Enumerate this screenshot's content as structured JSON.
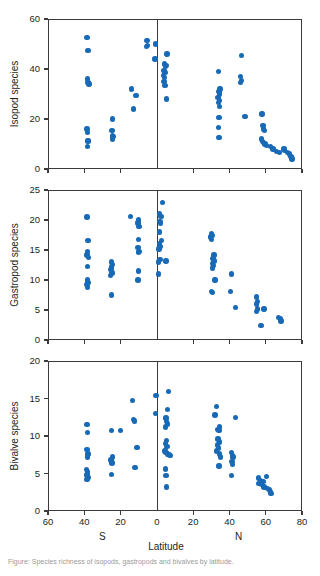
{
  "figure": {
    "xlabel": "Latitude",
    "hemisphere_south": "S",
    "hemisphere_north": "N",
    "marker_color": "#1869b6",
    "axis_color": "#3b3b3b",
    "caption": "Figure: Species richness of isopods, gastropods and bivalves by latitude."
  },
  "chart_data": [
    {
      "type": "scatter",
      "title": "",
      "ylabel": "Isopod species",
      "xlabel": "Latitude",
      "xlim": [
        -60,
        80
      ],
      "ylim": [
        0,
        60
      ],
      "xticks": [
        -60,
        -40,
        -20,
        0,
        20,
        40,
        60,
        80
      ],
      "xticklabels": [
        "60",
        "40",
        "20",
        "0",
        "20",
        "40",
        "60",
        "80"
      ],
      "yticks": [
        0,
        20,
        40,
        60
      ],
      "yticklabels": [
        "0",
        "20",
        "40",
        "60"
      ],
      "grid": false,
      "legend": "none",
      "series": [
        {
          "name": "Isopod species",
          "points": [
            [
              -38.5,
              52.5
            ],
            [
              -38.0,
              47.5
            ],
            [
              -38.2,
              36.0
            ],
            [
              -38.0,
              34.5
            ],
            [
              -37.5,
              34.0
            ],
            [
              -38.6,
              16.0
            ],
            [
              -38.2,
              14.5
            ],
            [
              -38.0,
              11.5
            ],
            [
              -37.9,
              11.0
            ],
            [
              -38.4,
              9.0
            ],
            [
              -24.5,
              20.0
            ],
            [
              -24.8,
              15.5
            ],
            [
              -24.4,
              13.5
            ],
            [
              -24.2,
              13.0
            ],
            [
              -24.6,
              12.0
            ],
            [
              -14.0,
              32.0
            ],
            [
              -11.5,
              29.5
            ],
            [
              -12.8,
              24.0
            ],
            [
              -5.5,
              51.5
            ],
            [
              -5.3,
              49.5
            ],
            [
              -5.6,
              49.0
            ],
            [
              -0.8,
              50.0
            ],
            [
              -1.0,
              44.0
            ],
            [
              5.5,
              46.0
            ],
            [
              4.2,
              42.0
            ],
            [
              5.0,
              41.5
            ],
            [
              4.6,
              41.0
            ],
            [
              4.0,
              39.5
            ],
            [
              4.4,
              38.5
            ],
            [
              3.8,
              37.5
            ],
            [
              4.2,
              36.5
            ],
            [
              3.9,
              35.0
            ],
            [
              4.4,
              33.5
            ],
            [
              5.2,
              28.0
            ],
            [
              34.0,
              39.0
            ],
            [
              34.8,
              32.0
            ],
            [
              34.2,
              31.0
            ],
            [
              34.6,
              30.0
            ],
            [
              33.8,
              28.5
            ],
            [
              34.4,
              27.5
            ],
            [
              34.0,
              26.5
            ],
            [
              34.6,
              25.0
            ],
            [
              34.2,
              20.5
            ],
            [
              34.0,
              16.5
            ],
            [
              34.3,
              12.5
            ],
            [
              46.5,
              45.5
            ],
            [
              46.2,
              37.0
            ],
            [
              46.6,
              35.5
            ],
            [
              46.0,
              34.5
            ],
            [
              48.5,
              21.0
            ],
            [
              58.0,
              22.0
            ],
            [
              58.4,
              17.5
            ],
            [
              58.8,
              16.0
            ],
            [
              59.2,
              15.5
            ],
            [
              57.6,
              12.0
            ],
            [
              58.2,
              11.0
            ],
            [
              58.8,
              10.5
            ],
            [
              59.6,
              10.0
            ],
            [
              60.4,
              9.5
            ],
            [
              62.5,
              9.0
            ],
            [
              64.0,
              8.0
            ],
            [
              66.0,
              7.0
            ],
            [
              67.5,
              6.5
            ],
            [
              70.0,
              8.0
            ],
            [
              70.5,
              7.5
            ],
            [
              72.0,
              6.5
            ],
            [
              73.0,
              6.0
            ],
            [
              74.0,
              5.0
            ],
            [
              74.5,
              4.0
            ]
          ]
        }
      ]
    },
    {
      "type": "scatter",
      "title": "",
      "ylabel": "Gastropod species",
      "xlabel": "Latitude",
      "xlim": [
        -60,
        80
      ],
      "ylim": [
        0,
        25
      ],
      "xticks": [
        -60,
        -40,
        -20,
        0,
        20,
        40,
        60,
        80
      ],
      "xticklabels": [
        "60",
        "40",
        "20",
        "0",
        "20",
        "40",
        "60",
        "80"
      ],
      "yticks": [
        0,
        5,
        10,
        15,
        20,
        25
      ],
      "yticklabels": [
        "0",
        "5",
        "10",
        "15",
        "20",
        "25"
      ],
      "grid": false,
      "legend": "none",
      "series": [
        {
          "name": "Gastropod species",
          "points": [
            [
              -38.5,
              20.5
            ],
            [
              -38.0,
              16.6
            ],
            [
              -38.3,
              14.8
            ],
            [
              -38.6,
              14.2
            ],
            [
              -37.8,
              13.8
            ],
            [
              -38.2,
              12.3
            ],
            [
              -38.4,
              10.0
            ],
            [
              -38.0,
              9.6
            ],
            [
              -38.6,
              9.3
            ],
            [
              -38.2,
              8.8
            ],
            [
              -25.0,
              13.0
            ],
            [
              -24.6,
              12.6
            ],
            [
              -24.9,
              12.2
            ],
            [
              -25.2,
              11.8
            ],
            [
              -24.7,
              11.2
            ],
            [
              -25.4,
              10.8
            ],
            [
              -25.0,
              7.5
            ],
            [
              -14.5,
              20.6
            ],
            [
              -10.0,
              20.0
            ],
            [
              -10.3,
              19.5
            ],
            [
              -9.8,
              18.9
            ],
            [
              -10.1,
              16.8
            ],
            [
              -10.4,
              15.4
            ],
            [
              -9.9,
              14.8
            ],
            [
              -10.2,
              14.6
            ],
            [
              -10.0,
              11.5
            ],
            [
              -10.3,
              10.0
            ],
            [
              3.0,
              22.9
            ],
            [
              1.5,
              21.0
            ],
            [
              2.2,
              20.6
            ],
            [
              1.8,
              19.8
            ],
            [
              2.0,
              19.4
            ],
            [
              1.6,
              18.0
            ],
            [
              2.4,
              16.6
            ],
            [
              1.4,
              16.0
            ],
            [
              2.0,
              15.6
            ],
            [
              1.2,
              15.2
            ],
            [
              1.8,
              13.4
            ],
            [
              1.0,
              13.0
            ],
            [
              5.0,
              13.2
            ],
            [
              0.8,
              11.0
            ],
            [
              30.0,
              17.8
            ],
            [
              30.6,
              17.4
            ],
            [
              29.6,
              17.2
            ],
            [
              30.2,
              16.8
            ],
            [
              31.5,
              14.2
            ],
            [
              31.0,
              13.6
            ],
            [
              31.4,
              13.2
            ],
            [
              30.8,
              12.8
            ],
            [
              31.2,
              12.4
            ],
            [
              30.6,
              12.0
            ],
            [
              32.0,
              10.0
            ],
            [
              30.0,
              8.1
            ],
            [
              30.5,
              7.9
            ],
            [
              41.0,
              11.0
            ],
            [
              40.5,
              8.1
            ],
            [
              43.5,
              5.4
            ],
            [
              55.0,
              7.2
            ],
            [
              55.4,
              6.4
            ],
            [
              55.0,
              6.0
            ],
            [
              55.6,
              5.2
            ],
            [
              54.8,
              4.8
            ],
            [
              59.0,
              5.2
            ],
            [
              57.5,
              2.4
            ],
            [
              67.0,
              3.8
            ],
            [
              68.0,
              3.5
            ],
            [
              68.5,
              3.2
            ]
          ]
        }
      ]
    },
    {
      "type": "scatter",
      "title": "",
      "ylabel": "Bivalve species",
      "xlabel": "Latitude",
      "xlim": [
        -60,
        80
      ],
      "ylim": [
        0,
        20
      ],
      "xticks": [
        -60,
        -40,
        -20,
        0,
        20,
        40,
        60,
        80
      ],
      "xticklabels": [
        "60",
        "40",
        "20",
        "0",
        "20",
        "40",
        "60",
        "80"
      ],
      "yticks": [
        0,
        5,
        10,
        15,
        20
      ],
      "yticklabels": [
        "0",
        "5",
        "10",
        "15",
        "20"
      ],
      "grid": false,
      "legend": "none",
      "series": [
        {
          "name": "Bivalve species",
          "points": [
            [
              -38.5,
              11.5
            ],
            [
              -38.2,
              10.5
            ],
            [
              -38.6,
              8.2
            ],
            [
              -38.0,
              7.6
            ],
            [
              -38.4,
              7.2
            ],
            [
              -38.8,
              5.5
            ],
            [
              -38.2,
              5.2
            ],
            [
              -38.6,
              4.8
            ],
            [
              -38.0,
              4.5
            ],
            [
              -38.5,
              4.2
            ],
            [
              -25.0,
              10.7
            ],
            [
              -24.6,
              7.2
            ],
            [
              -25.2,
              6.8
            ],
            [
              -24.8,
              6.4
            ],
            [
              -25.0,
              4.9
            ],
            [
              -20.0,
              10.7
            ],
            [
              -13.5,
              14.7
            ],
            [
              -13.0,
              12.2
            ],
            [
              -12.4,
              12.0
            ],
            [
              -11.0,
              8.5
            ],
            [
              -12.0,
              5.8
            ],
            [
              -0.5,
              15.4
            ],
            [
              -0.8,
              13.0
            ],
            [
              6.5,
              15.9
            ],
            [
              6.0,
              13.5
            ],
            [
              5.0,
              12.4
            ],
            [
              5.4,
              11.9
            ],
            [
              5.8,
              11.6
            ],
            [
              4.6,
              11.2
            ],
            [
              5.2,
              9.4
            ],
            [
              4.8,
              9.0
            ],
            [
              5.6,
              8.6
            ],
            [
              4.4,
              8.0
            ],
            [
              5.0,
              7.8
            ],
            [
              6.0,
              7.6
            ],
            [
              6.6,
              7.5
            ],
            [
              7.2,
              7.4
            ],
            [
              4.6,
              5.6
            ],
            [
              5.0,
              4.7
            ],
            [
              5.4,
              3.2
            ],
            [
              33.0,
              13.9
            ],
            [
              32.0,
              12.8
            ],
            [
              34.5,
              11.2
            ],
            [
              33.6,
              10.9
            ],
            [
              34.2,
              10.7
            ],
            [
              33.8,
              9.6
            ],
            [
              34.4,
              9.2
            ],
            [
              33.4,
              8.8
            ],
            [
              34.0,
              8.4
            ],
            [
              33.0,
              8.0
            ],
            [
              34.6,
              7.6
            ],
            [
              35.0,
              7.2
            ],
            [
              34.2,
              6.0
            ],
            [
              43.5,
              12.5
            ],
            [
              41.0,
              7.8
            ],
            [
              41.6,
              7.4
            ],
            [
              42.0,
              7.2
            ],
            [
              41.4,
              6.6
            ],
            [
              41.8,
              6.2
            ],
            [
              41.2,
              4.7
            ],
            [
              56.0,
              4.4
            ],
            [
              57.0,
              4.0
            ],
            [
              56.4,
              3.7
            ],
            [
              57.6,
              3.5
            ],
            [
              58.5,
              3.9
            ],
            [
              59.0,
              3.2
            ],
            [
              60.5,
              4.6
            ],
            [
              61.0,
              3.0
            ],
            [
              62.0,
              2.8
            ],
            [
              62.8,
              2.6
            ],
            [
              63.0,
              2.3
            ]
          ]
        }
      ]
    }
  ]
}
